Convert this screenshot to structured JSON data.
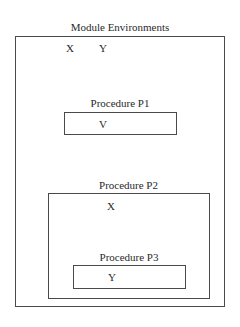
{
  "diagram": {
    "module": {
      "title": "Module Environments",
      "variables": [
        "X",
        "Y"
      ]
    },
    "procedures": [
      {
        "title": "Procedure P1",
        "variables": [
          "V"
        ]
      },
      {
        "title": "Procedure P2",
        "variables": [
          "X"
        ],
        "nested": {
          "title": "Procedure P3",
          "variables": [
            "Y"
          ]
        }
      }
    ]
  },
  "colors": {
    "border": "#4a4a4a",
    "text": "#2a2a2a",
    "background": "#ffffff"
  }
}
